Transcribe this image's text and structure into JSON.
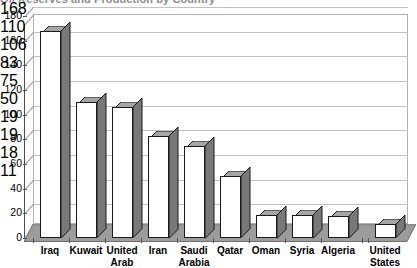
{
  "chart_data": {
    "type": "bar",
    "title": "Oil Reserves and Production by Country",
    "subtitle": "",
    "xlabel": "",
    "ylabel": "",
    "categories": [
      "Iraq",
      "Kuwait",
      "United Arab",
      "Iran",
      "Saudi Arabia",
      "Qatar",
      "Oman",
      "Syria",
      "Algeria",
      "United States"
    ],
    "values": [
      168,
      110,
      106,
      83,
      75,
      50,
      19,
      19,
      18,
      11
    ],
    "data_labels": [
      "168",
      "110",
      "106",
      "83",
      "75",
      "50",
      "19",
      "19",
      "18",
      "11"
    ],
    "ylim": [
      0,
      180
    ],
    "yticks": [
      0,
      20,
      40,
      60,
      80,
      100,
      120,
      140,
      160,
      180
    ],
    "ytick_labels": [
      "0",
      "20",
      "40",
      "60",
      "80",
      "100",
      "120",
      "140",
      "160",
      "180"
    ],
    "grid": true,
    "legend": false,
    "legend_position": "none",
    "style": "3d-column",
    "colors": {
      "bar_face": "#ffffff",
      "bar_side": "#787878",
      "bar_top": "#a6a6a6",
      "bar_outline": "#1a1a1a",
      "floor": "#9c9c9c",
      "floor_top": "#8f8f8f",
      "gridline": "#c2c2c2",
      "wall_border": "#b2b2b2",
      "axis": "#4d4d4d",
      "text": "#000000"
    }
  }
}
